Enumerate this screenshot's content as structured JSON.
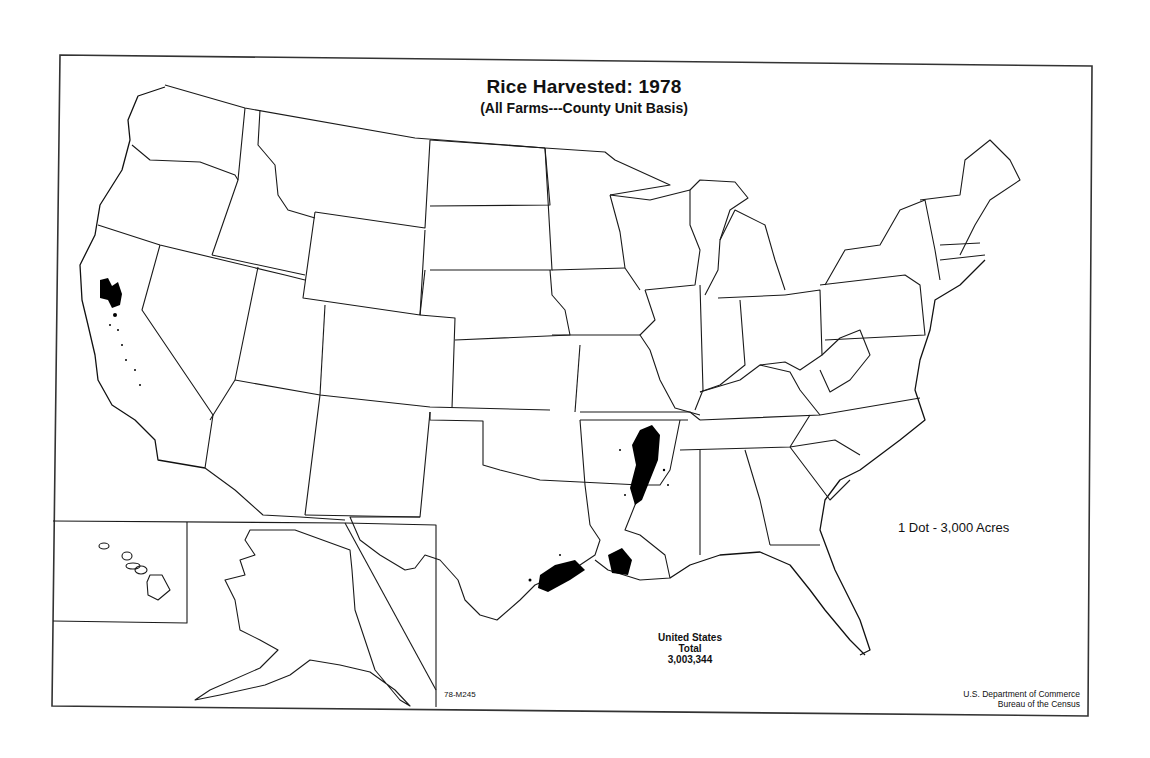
{
  "map": {
    "title": "Rice Harvested:  1978",
    "subtitle": "(All Farms---County Unit Basis)",
    "legend": "1 Dot - 3,000 Acres",
    "total": {
      "line1": "United States",
      "line2": "Total",
      "value": "3,003,344"
    },
    "map_code": "78-M245",
    "credit": {
      "line1": "U.S. Department of Commerce",
      "line2": "Bureau of the Census"
    },
    "insets": [
      "Hawaii",
      "Alaska"
    ],
    "dot_value_acres": 3000,
    "colors": {
      "background": "#ffffff",
      "lines": "#1a1a1a",
      "dots": "#000000"
    },
    "rice_regions": [
      "Sacramento Valley, California",
      "Arkansas / Mississippi Delta",
      "Southwest Louisiana",
      "Texas Gulf Coast"
    ]
  }
}
